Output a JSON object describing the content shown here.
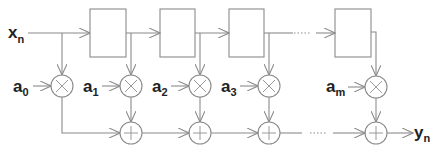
{
  "diagram": {
    "type": "FIR filter (transversal / tapped delay line)",
    "input": {
      "label": "x",
      "subscript": "n"
    },
    "output": {
      "label": "y",
      "subscript": "n"
    },
    "coefficients": [
      {
        "label": "a",
        "subscript": "0"
      },
      {
        "label": "a",
        "subscript": "1"
      },
      {
        "label": "a",
        "subscript": "2"
      },
      {
        "label": "a",
        "subscript": "3"
      },
      {
        "label": "a",
        "subscript": "m"
      }
    ],
    "delay_blocks": 5,
    "multiplier_symbol": "×",
    "adder_symbol": "+",
    "ellipsis": "......",
    "colors": {
      "line": "#8a8a8a",
      "text": "#222222",
      "background": "#ffffff"
    }
  }
}
